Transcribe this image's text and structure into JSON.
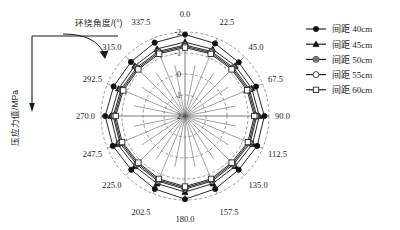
{
  "figure": {
    "angle_axis_title": "环绕角度/(°)",
    "radial_axis_title": "压应力值/MPa"
  },
  "legend": {
    "items": [
      {
        "label": "间距 40cm",
        "marker": "filled-circle-marker"
      },
      {
        "label": "间距 45cm",
        "marker": "filled-triangle-marker"
      },
      {
        "label": "间距 50cm",
        "marker": "diamond-in-circle-marker"
      },
      {
        "label": "间距 55cm",
        "marker": "open-circle-marker"
      },
      {
        "label": "间距 60cm",
        "marker": "open-square-marker"
      }
    ]
  },
  "chart_data": {
    "type": "line",
    "projection": "polar",
    "title": "",
    "xlabel": "环绕角度/(°)",
    "ylabel": "压应力值/MPa",
    "grid": true,
    "legend_position": "right",
    "angle_unit": "degrees",
    "angle_direction": "clockwise",
    "angle_zero_at": "top",
    "categories": [
      "0.0",
      "22.5",
      "45.0",
      "67.5",
      "90.0",
      "112.5",
      "135.0",
      "157.5",
      "180.0",
      "202.5",
      "225.0",
      "247.5",
      "270.0",
      "292.5",
      "315.0",
      "337.5"
    ],
    "rticks": [
      "-2",
      "-1",
      "0",
      "1",
      "2"
    ],
    "rlim": [
      2,
      -2
    ],
    "r_inverted": true,
    "series": [
      {
        "name": "间距 40cm",
        "marker": "filled-circle-marker",
        "values": [
          -1.88,
          -1.74,
          -1.62,
          -1.66,
          -1.78,
          -1.72,
          -1.62,
          -1.76,
          -1.96,
          -1.76,
          -1.62,
          -1.72,
          -1.8,
          -1.68,
          -1.64,
          -1.78
        ]
      },
      {
        "name": "间距 45cm",
        "marker": "filled-triangle-marker",
        "values": [
          -1.52,
          -1.44,
          -1.38,
          -1.44,
          -1.54,
          -1.48,
          -1.38,
          -1.48,
          -1.62,
          -1.48,
          -1.38,
          -1.48,
          -1.54,
          -1.42,
          -1.38,
          -1.46
        ]
      },
      {
        "name": "间距 50cm",
        "marker": "diamond-in-circle-marker",
        "values": [
          -1.38,
          -1.32,
          -1.26,
          -1.32,
          -1.42,
          -1.36,
          -1.26,
          -1.36,
          -1.48,
          -1.36,
          -1.26,
          -1.36,
          -1.42,
          -1.3,
          -1.26,
          -1.33
        ]
      },
      {
        "name": "间距 55cm",
        "marker": "open-circle-marker",
        "values": [
          -1.32,
          -1.26,
          -1.2,
          -1.26,
          -1.36,
          -1.3,
          -1.2,
          -1.3,
          -1.42,
          -1.3,
          -1.2,
          -1.3,
          -1.36,
          -1.24,
          -1.2,
          -1.27
        ]
      },
      {
        "name": "间距 60cm",
        "marker": "open-square-marker",
        "values": [
          -1.26,
          -1.2,
          -1.14,
          -1.2,
          -1.3,
          -1.24,
          -1.14,
          -1.24,
          -1.36,
          -1.24,
          -1.14,
          -1.24,
          -1.3,
          -1.18,
          -1.14,
          -1.21
        ]
      }
    ]
  }
}
